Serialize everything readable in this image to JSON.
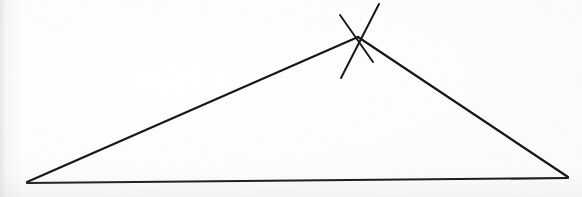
{
  "figure": {
    "medium": "pen on white paper",
    "canvas": {
      "width": 582,
      "height": 197
    },
    "background_color": "#fefefe",
    "ink_color": "#17171a",
    "stroke_width": 2.1
  },
  "geometry": {
    "type": "triangle",
    "classification": "obtuse scalene",
    "vertices": [
      {
        "label": "left-vertex",
        "name": "bottom-left apex",
        "x": 27,
        "y": 182
      },
      {
        "label": "apex-vertex",
        "name": "top apex",
        "x": 358,
        "y": 37
      },
      {
        "label": "right-vertex",
        "name": "bottom-right apex",
        "x": 568,
        "y": 177
      }
    ],
    "edges": [
      {
        "name": "left-edge",
        "from": "left-vertex",
        "to": "apex-vertex",
        "path": "M 27 182 L 358 37"
      },
      {
        "name": "right-edge",
        "from": "apex-vertex",
        "to": "right-vertex",
        "path": "M 358 37 L 568 177"
      },
      {
        "name": "base-edge",
        "from": "left-vertex",
        "to": "right-vertex",
        "path": "M 27 183 L 568 178"
      }
    ],
    "annotations": [
      {
        "name": "apex-cross-mark",
        "kind": "x-tick-mark",
        "description": "two crossing pen strokes marking the apex vertex",
        "strokes": [
          {
            "name": "cross-stroke-major",
            "path": "M 379 4 L 341 78"
          },
          {
            "name": "cross-stroke-minor",
            "path": "M 340 15 L 373 62"
          }
        ]
      }
    ]
  }
}
